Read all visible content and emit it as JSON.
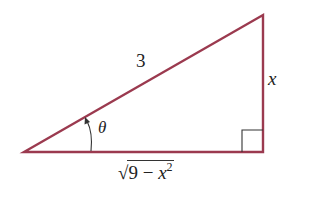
{
  "diagram": {
    "type": "right-triangle",
    "colors": {
      "triangle": "#9b3a4f",
      "right_angle_marker": "#333333",
      "text": "#222222"
    },
    "vertices": {
      "left": [
        24,
        152
      ],
      "bottom_right": [
        263,
        152
      ],
      "top_right": [
        263,
        15
      ]
    },
    "labels": {
      "hypotenuse": "3",
      "opposite": "x",
      "angle": "θ",
      "adjacent_radical": "√",
      "adjacent_body": "9 − x",
      "adjacent_exponent": "2"
    }
  }
}
